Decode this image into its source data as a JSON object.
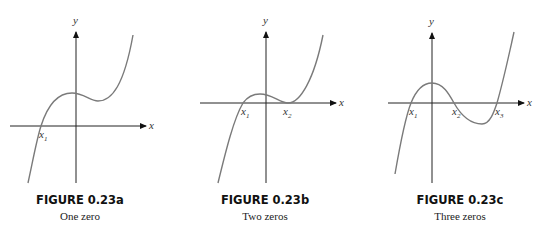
{
  "figures": [
    {
      "id": "a",
      "title": "FIGURE 0.23a",
      "subtitle": "One zero",
      "axis_labels": {
        "x": "x",
        "y": "y"
      },
      "zero_labels": [
        "x1"
      ],
      "zeros_count": 1
    },
    {
      "id": "b",
      "title": "FIGURE 0.23b",
      "subtitle": "Two zeros",
      "axis_labels": {
        "x": "x",
        "y": "y"
      },
      "zero_labels": [
        "x1",
        "x2"
      ],
      "zeros_count": 2
    },
    {
      "id": "c",
      "title": "FIGURE 0.23c",
      "subtitle": "Three zeros",
      "axis_labels": {
        "x": "x",
        "y": "y"
      },
      "zero_labels": [
        "x1",
        "x2",
        "x3"
      ],
      "zeros_count": 3
    }
  ],
  "colors": {
    "axis": "#222222",
    "curve": "#7a7a7a"
  }
}
